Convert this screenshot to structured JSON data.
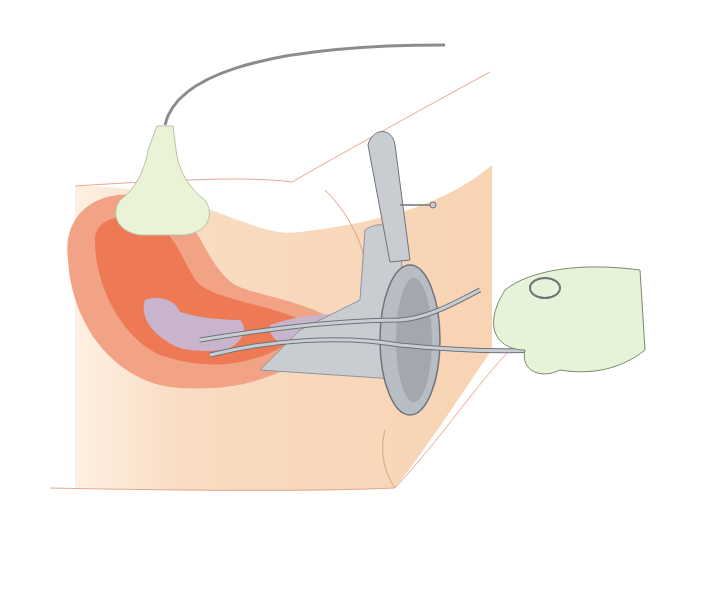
{
  "illustration": {
    "subject": "ultrasound-guided uterine evacuation with speculum and forceps",
    "colors": {
      "background": "#ffffff",
      "skin": "#f8d5b8",
      "skin_light": "#fbe6d2",
      "uterus_outer": "#f2a285",
      "uterus_inner": "#ee7a55",
      "tissue": "#c8b4cc",
      "instrument": "#c9cdd2",
      "instrument_dark": "#8f959c",
      "probe": "#eaf3d6",
      "glove": "#e6f3d8",
      "cable": "#8a8d90",
      "outline": "#e8a88f"
    }
  }
}
